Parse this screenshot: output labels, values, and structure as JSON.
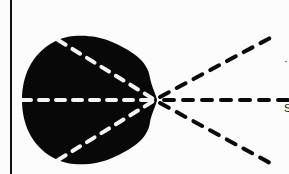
{
  "diagram": {
    "colors": {
      "background": "#fcfcfc",
      "shape_fill": "#080808",
      "inner_rays": "#f4f4f4",
      "outer_rays": "#0a0a0a",
      "border_line": "#111111"
    },
    "focal_point": {
      "x": 155,
      "y": 100
    },
    "inner_rays": [
      {
        "from": [
          58,
          40
        ],
        "to": [
          155,
          100
        ]
      },
      {
        "from": [
          22,
          100
        ],
        "to": [
          155,
          100
        ]
      },
      {
        "from": [
          58,
          160
        ],
        "to": [
          155,
          100
        ]
      }
    ],
    "outer_rays": [
      {
        "from": [
          155,
          100
        ],
        "to": [
          270,
          38
        ]
      },
      {
        "from": [
          155,
          100
        ],
        "to": [
          289,
          100
        ]
      },
      {
        "from": [
          155,
          100
        ],
        "to": [
          270,
          163
        ]
      }
    ],
    "edge_labels": [
      {
        "text": "·",
        "y": 62
      },
      {
        "text": "S",
        "y": 108
      }
    ]
  }
}
